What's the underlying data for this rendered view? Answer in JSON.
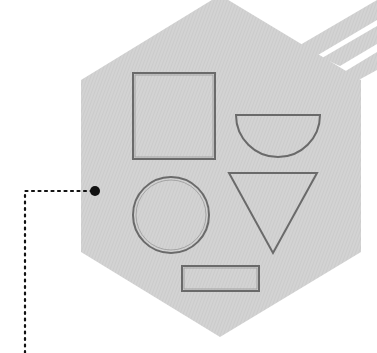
{
  "figure": {
    "background": "#ffffff",
    "hex_fill": "#d0d0d0",
    "stroke_color": "#6a6a6a",
    "leader_color": "#111111",
    "shapes": [
      "square",
      "half-circle",
      "circle",
      "inverted-triangle",
      "rectangle"
    ]
  }
}
